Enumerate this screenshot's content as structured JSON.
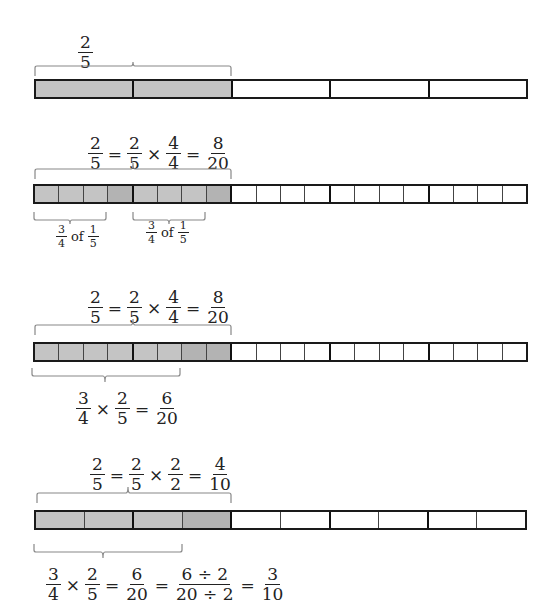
{
  "diagrams": [
    {
      "top_label": {
        "fraction": {
          "num": "2",
          "den": "5"
        }
      },
      "bar": {
        "units": 5,
        "subdivisions": 1,
        "shaded_parts": 2
      },
      "bottom_labels": []
    },
    {
      "top_label": {
        "equation": [
          {
            "num": "2",
            "den": "5"
          },
          {
            "op": "="
          },
          {
            "num": "2",
            "den": "5"
          },
          {
            "op": "×"
          },
          {
            "num": "4",
            "den": "4"
          },
          {
            "op": "="
          },
          {
            "num": "8",
            "den": "20"
          }
        ]
      },
      "bar": {
        "units": 5,
        "subdivisions": 4,
        "shaded_parts": 8
      },
      "bottom_labels": [
        {
          "pre": {
            "num": "3",
            "den": "4"
          },
          "word": "of",
          "post": {
            "num": "1",
            "den": "5"
          }
        },
        {
          "pre": {
            "num": "3",
            "den": "4"
          },
          "word": "of",
          "post": {
            "num": "1",
            "den": "5"
          }
        }
      ]
    },
    {
      "top_label": {
        "equation": [
          {
            "num": "2",
            "den": "5"
          },
          {
            "op": "="
          },
          {
            "num": "2",
            "den": "5"
          },
          {
            "op": "×"
          },
          {
            "num": "4",
            "den": "4"
          },
          {
            "op": "="
          },
          {
            "num": "8",
            "den": "20"
          }
        ]
      },
      "bar": {
        "units": 5,
        "subdivisions": 4,
        "shaded_parts": 8
      },
      "bottom_labels": [
        {
          "equation": [
            {
              "num": "3",
              "den": "4"
            },
            {
              "op": "×"
            },
            {
              "num": "2",
              "den": "5"
            },
            {
              "op": "="
            },
            {
              "num": "6",
              "den": "20"
            }
          ]
        }
      ]
    },
    {
      "top_label": {
        "equation": [
          {
            "num": "2",
            "den": "5"
          },
          {
            "op": "="
          },
          {
            "num": "2",
            "den": "5"
          },
          {
            "op": "×"
          },
          {
            "num": "2",
            "den": "2"
          },
          {
            "op": "="
          },
          {
            "num": "4",
            "den": "10"
          }
        ]
      },
      "bar": {
        "units": 5,
        "subdivisions": 2,
        "shaded_parts": 4
      },
      "bottom_labels": [
        {
          "equation": [
            {
              "num": "3",
              "den": "4"
            },
            {
              "op": "×"
            },
            {
              "num": "2",
              "den": "5"
            },
            {
              "op": "="
            },
            {
              "num": "6",
              "den": "20"
            },
            {
              "op": "="
            },
            {
              "num": "6 ÷ 2",
              "den": "20 ÷ 2"
            },
            {
              "op": "="
            },
            {
              "num": "3",
              "den": "10"
            }
          ]
        }
      ]
    }
  ],
  "colors": {
    "shade": "#c4c4c4",
    "shade_dark": "#b3b3b3",
    "border": "#1a1a1a"
  }
}
